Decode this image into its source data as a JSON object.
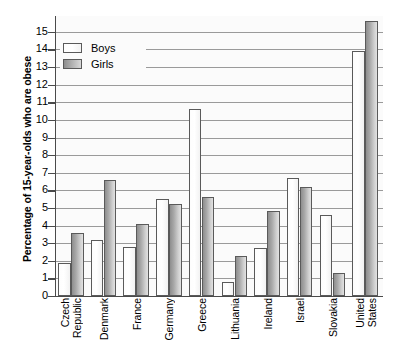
{
  "chart_data": {
    "type": "bar",
    "title": "",
    "xlabel": "",
    "ylabel": "Percentage of 15-year-olds who are obese",
    "ylim": [
      0,
      15.9
    ],
    "ytick_labels": [
      "0",
      "1",
      "2",
      "3",
      "4",
      "5",
      "6",
      "7",
      "8",
      "9",
      "10",
      "11",
      "12",
      "13",
      "14",
      "15"
    ],
    "ytick_values": [
      0,
      1,
      2,
      3,
      4,
      5,
      6,
      7,
      8,
      9,
      10,
      11,
      12,
      13,
      14,
      15
    ],
    "grid": true,
    "legend_position": "upper-left-inside",
    "categories": [
      "Czech Republic",
      "Denmark",
      "France",
      "Germany",
      "Greece",
      "Lithuania",
      "Ireland",
      "Israel",
      "Slovakia",
      "United States"
    ],
    "category_lines": [
      [
        "Czech",
        "Republic"
      ],
      [
        "Denmark"
      ],
      [
        "France"
      ],
      [
        "Germany"
      ],
      [
        "Greece"
      ],
      [
        "Lithuania"
      ],
      [
        "Ireland"
      ],
      [
        "Israel"
      ],
      [
        "Slovakia"
      ],
      [
        "United",
        "States"
      ]
    ],
    "series": [
      {
        "name": "Boys",
        "color": "#ffffff",
        "values": [
          1.9,
          3.2,
          2.8,
          5.5,
          10.6,
          0.8,
          2.7,
          6.7,
          4.6,
          13.9
        ]
      },
      {
        "name": "Girls",
        "color": "#a8a8a8",
        "values": [
          3.6,
          6.6,
          4.1,
          5.2,
          5.6,
          2.3,
          4.8,
          6.2,
          1.3,
          15.6
        ]
      }
    ]
  },
  "legend": {
    "items": [
      {
        "label": "Boys"
      },
      {
        "label": "Girls"
      }
    ]
  }
}
